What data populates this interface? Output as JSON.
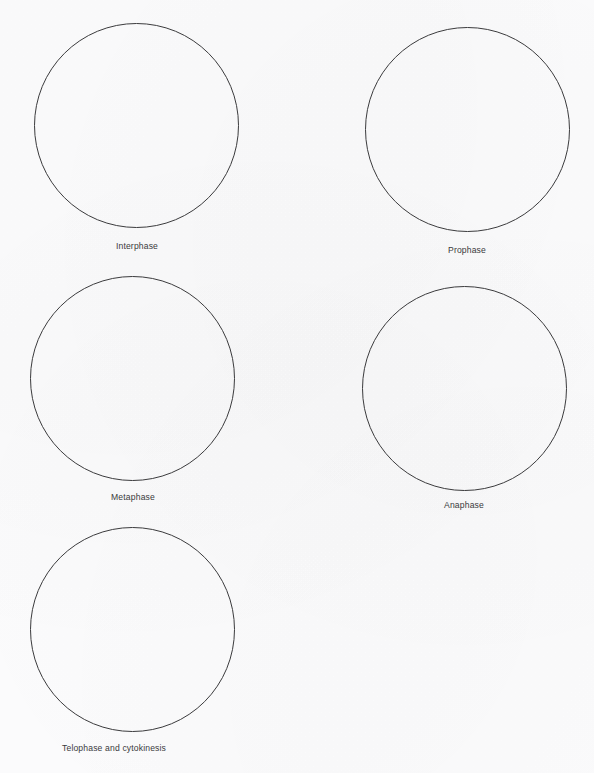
{
  "page": {
    "background_color": "#fcfcfd",
    "ink_color": "#3b3b3d",
    "label_color": "#3a3a3c",
    "width": 594,
    "height": 773
  },
  "figures": [
    {
      "id": "interphase",
      "label": "Interphase",
      "shape": "circle",
      "diameter": 205,
      "x": 34,
      "y": 23,
      "label_x": 137,
      "label_y": 241,
      "label_align": "centered"
    },
    {
      "id": "prophase",
      "label": "Prophase",
      "shape": "circle",
      "diameter": 205,
      "x": 365,
      "y": 27,
      "label_x": 467,
      "label_y": 245,
      "label_align": "centered"
    },
    {
      "id": "metaphase",
      "label": "Metaphase",
      "shape": "circle",
      "diameter": 205,
      "x": 30,
      "y": 276,
      "label_x": 133,
      "label_y": 492,
      "label_align": "centered"
    },
    {
      "id": "anaphase",
      "label": "Anaphase",
      "shape": "circle",
      "diameter": 205,
      "x": 362,
      "y": 286,
      "label_x": 464,
      "label_y": 500,
      "label_align": "centered"
    },
    {
      "id": "telophase-and-cytokinesis",
      "label": "Telophase and cytokinesis",
      "shape": "circle",
      "diameter": 205,
      "x": 30,
      "y": 527,
      "label_x": 62,
      "label_y": 743,
      "label_align": "left"
    }
  ]
}
